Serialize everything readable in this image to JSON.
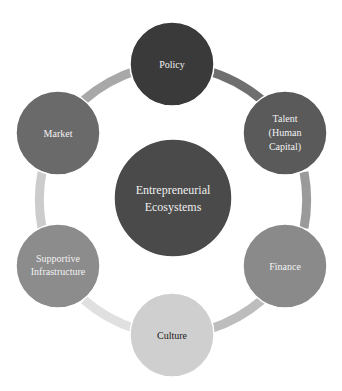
{
  "diagram": {
    "center": {
      "label_line1": "Entrepreneurial",
      "label_line2": "Ecosystems",
      "color": "#4a4a4a"
    },
    "nodes": [
      {
        "id": "policy",
        "lines": [
          "Policy"
        ],
        "color": "#3a3a3a",
        "text_color": "#f2f2f2"
      },
      {
        "id": "talent",
        "lines": [
          "Talent",
          "(Human",
          "Capital)"
        ],
        "color": "#5a5a5a",
        "text_color": "#f2f2f2"
      },
      {
        "id": "finance",
        "lines": [
          "Finance"
        ],
        "color": "#8a8a8a",
        "text_color": "#f2f2f2"
      },
      {
        "id": "culture",
        "lines": [
          "Culture"
        ],
        "color": "#cfcfcf",
        "text_color": "#1a1a1a"
      },
      {
        "id": "supportive-infrastructure",
        "lines": [
          "Supportive",
          "Infrastructure"
        ],
        "color": "#8c8c8c",
        "text_color": "#f2f2f2"
      },
      {
        "id": "market",
        "lines": [
          "Market"
        ],
        "color": "#6a6a6a",
        "text_color": "#f2f2f2"
      }
    ],
    "ring_segments": [
      {
        "from": "policy",
        "to": "talent",
        "color": "#6f6f6f"
      },
      {
        "from": "talent",
        "to": "finance",
        "color": "#9a9a9a"
      },
      {
        "from": "finance",
        "to": "culture",
        "color": "#bdbdbd"
      },
      {
        "from": "culture",
        "to": "supportive-infrastructure",
        "color": "#e0e0e0"
      },
      {
        "from": "supportive-infrastructure",
        "to": "market",
        "color": "#cccccc"
      },
      {
        "from": "market",
        "to": "policy",
        "color": "#a8a8a8"
      }
    ]
  }
}
